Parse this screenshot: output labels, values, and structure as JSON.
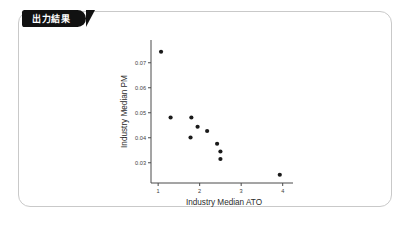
{
  "panel": {
    "badge_label": "出力結果",
    "border_color": "#c9c9c9",
    "badge_bg": "#111111",
    "badge_fg": "#ffffff",
    "background": "#ffffff"
  },
  "chart_data": {
    "type": "scatter",
    "title": "",
    "xlabel": "Industry Median ATO",
    "ylabel": "Industry Median PM",
    "xlim": [
      0.9,
      4.2
    ],
    "ylim": [
      0.0235,
      0.0775
    ],
    "xticks": [
      1,
      2,
      3,
      4
    ],
    "xtick_labels": [
      "1",
      "2",
      "3",
      "4"
    ],
    "yticks": [
      0.03,
      0.04,
      0.05,
      0.06,
      0.07
    ],
    "ytick_labels": [
      "0.03",
      "0.04",
      "0.05",
      "0.06",
      "0.07"
    ],
    "grid": false,
    "legend": false,
    "marker_color": "#1a1a1a",
    "marker_size": 2.1,
    "points": [
      {
        "x": 1.07,
        "y": 0.0744
      },
      {
        "x": 1.3,
        "y": 0.0481
      },
      {
        "x": 1.8,
        "y": 0.0481
      },
      {
        "x": 1.95,
        "y": 0.0444
      },
      {
        "x": 2.18,
        "y": 0.0427
      },
      {
        "x": 1.78,
        "y": 0.0401
      },
      {
        "x": 2.42,
        "y": 0.0376
      },
      {
        "x": 2.5,
        "y": 0.0345
      },
      {
        "x": 2.5,
        "y": 0.0315
      },
      {
        "x": 3.93,
        "y": 0.0252
      }
    ]
  }
}
